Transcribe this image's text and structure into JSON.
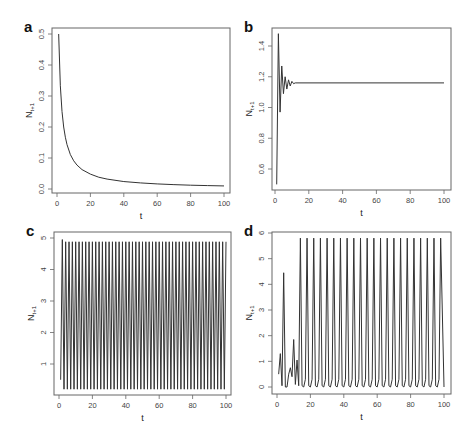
{
  "figure": {
    "background": "#ffffff",
    "line_color": "#333333",
    "frame_color": "#666666"
  },
  "chart_data": [
    {
      "panel": "a",
      "type": "line",
      "title": "",
      "xlabel": "t",
      "ylabel": "N_{t+1}",
      "ylabel_display": "Nt+1",
      "xlim": [
        0,
        100
      ],
      "ylim": [
        0.0,
        0.5
      ],
      "xticks": [
        0,
        20,
        40,
        60,
        80,
        100
      ],
      "yticks": [
        0.0,
        0.1,
        0.2,
        0.3,
        0.4,
        0.5
      ],
      "ytick_labels": [
        "0.0",
        "0.1",
        "0.2",
        "0.3",
        "0.4",
        "0.5"
      ],
      "grid": false,
      "legend": null,
      "description": "Monotone decay from 0.5 toward ~0.01",
      "x": [
        1,
        2,
        3,
        4,
        5,
        6,
        8,
        10,
        12,
        15,
        20,
        25,
        30,
        40,
        50,
        60,
        70,
        80,
        90,
        100
      ],
      "y": [
        0.5,
        0.333,
        0.25,
        0.2,
        0.167,
        0.143,
        0.111,
        0.091,
        0.077,
        0.0625,
        0.048,
        0.038,
        0.032,
        0.024,
        0.0196,
        0.0164,
        0.0141,
        0.0123,
        0.011,
        0.0099
      ],
      "box": {
        "left": 52,
        "top": 28,
        "right": 230,
        "bottom": 193
      },
      "yaxis_px": {
        "v0": 0.0,
        "p0": 189,
        "v1": 0.5,
        "p1": 34
      },
      "xaxis_px": {
        "v0": 0,
        "p0": 57,
        "v1": 100,
        "p1": 224
      }
    },
    {
      "panel": "b",
      "type": "line",
      "title": "",
      "xlabel": "t",
      "ylabel": "N_{t+1}",
      "ylabel_display": "Nt+1",
      "xlim": [
        0,
        100
      ],
      "ylim": [
        0.5,
        1.5
      ],
      "xticks": [
        0,
        20,
        40,
        60,
        80,
        100
      ],
      "yticks": [
        0.6,
        0.8,
        1.0,
        1.2,
        1.4
      ],
      "ytick_labels": [
        "0.6",
        "0.8",
        "1.0",
        "1.2",
        "1.4"
      ],
      "grid": false,
      "legend": null,
      "description": "Damped oscillation converging to ~1.16",
      "x": [
        1,
        2,
        3,
        4,
        5,
        6,
        7,
        8,
        9,
        10,
        11,
        12,
        100
      ],
      "y": [
        0.5,
        1.48,
        0.97,
        1.27,
        1.09,
        1.2,
        1.12,
        1.18,
        1.14,
        1.17,
        1.155,
        1.16,
        1.16
      ],
      "box": {
        "left": 272,
        "top": 28,
        "right": 451,
        "bottom": 190
      },
      "yaxis_px": {
        "v0": 0.6,
        "p0": 169,
        "v1": 1.4,
        "p1": 46
      },
      "xaxis_px": {
        "v0": 0,
        "p0": 275,
        "v1": 100,
        "p1": 444
      }
    },
    {
      "panel": "c",
      "type": "line",
      "title": "",
      "xlabel": "t",
      "ylabel": "N_{t+1}",
      "ylabel_display": "Nt+1",
      "xlim": [
        0,
        100
      ],
      "ylim": [
        0,
        5
      ],
      "xticks": [
        0,
        20,
        40,
        60,
        80,
        100
      ],
      "yticks": [
        1,
        2,
        3,
        4,
        5
      ],
      "ytick_labels": [
        "1",
        "2",
        "3",
        "4",
        "5"
      ],
      "grid": false,
      "legend": null,
      "description": "Stable period-2 oscillation between ~0.2 and ~4.9",
      "pattern": {
        "start_x": 1,
        "start_y": 0.5,
        "high": 4.88,
        "low": 0.2,
        "period": 2,
        "first_peak": 4.95,
        "n_points": 100
      },
      "box": {
        "left": 54,
        "top": 232,
        "right": 231,
        "bottom": 395
      },
      "yaxis_px": {
        "v0": 1,
        "p0": 364,
        "v1": 5,
        "p1": 238
      },
      "xaxis_px": {
        "v0": 0,
        "p0": 59,
        "v1": 100,
        "p1": 226
      }
    },
    {
      "panel": "d",
      "type": "line",
      "title": "",
      "xlabel": "t",
      "ylabel": "N_{t+1}",
      "ylabel_display": "Nt+1",
      "xlim": [
        0,
        100
      ],
      "ylim": [
        0,
        6
      ],
      "xticks": [
        0,
        20,
        40,
        60,
        80,
        100
      ],
      "yticks": [
        0,
        1,
        2,
        3,
        4,
        5,
        6
      ],
      "ytick_labels": [
        "0",
        "1",
        "2",
        "3",
        "4",
        "5",
        "6"
      ],
      "grid": false,
      "legend": null,
      "description": "Irregular transient then periodic spikes (~period 4) reaching ~5.8",
      "x": [
        1,
        2,
        3,
        4,
        5,
        6,
        7,
        8,
        9,
        10,
        11,
        12,
        13,
        14
      ],
      "y": [
        0.5,
        1.3,
        0.05,
        4.45,
        0.0,
        0.0,
        0.5,
        0.75,
        0.4,
        1.85,
        0.1,
        1.05,
        0.05,
        5.8
      ],
      "spikes": {
        "start_t": 14,
        "period": 4,
        "peak": 5.8,
        "trough": 0.0,
        "end_t": 100
      },
      "box": {
        "left": 272,
        "top": 232,
        "right": 451,
        "bottom": 394
      },
      "yaxis_px": {
        "v0": 0,
        "p0": 387,
        "v1": 6,
        "p1": 233
      },
      "xaxis_px": {
        "v0": 0,
        "p0": 277,
        "v1": 100,
        "p1": 444
      }
    }
  ],
  "caption_fragment": "... of 100 ... and ... period ..."
}
